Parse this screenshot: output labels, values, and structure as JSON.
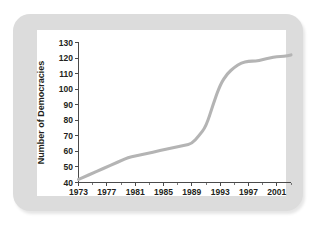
{
  "figure": {
    "frame_color": "#dcdcdc",
    "panel_color": "#ffffff"
  },
  "chart_data": {
    "type": "line",
    "title": "",
    "xlabel": "",
    "ylabel": "Number of Democracies",
    "xlim": [
      1973,
      2003
    ],
    "ylim": [
      40,
      130
    ],
    "grid": false,
    "legend": "none",
    "line_color": "#b4b4b4",
    "axis_color": "#4a4a4a",
    "xticks": [
      1973,
      1977,
      1981,
      1985,
      1989,
      1993,
      1997,
      2001
    ],
    "xtick_labels": [
      "1973",
      "1977",
      "1981",
      "1985",
      "1989",
      "1993",
      "1997",
      "2001"
    ],
    "xminor_ticks": [
      1975,
      1979,
      1983,
      1987,
      1991,
      1995,
      1999,
      2003
    ],
    "yticks": [
      40,
      50,
      60,
      70,
      80,
      90,
      100,
      110,
      120,
      130
    ],
    "ytick_labels": [
      "40",
      "50",
      "60",
      "70",
      "80",
      "90",
      "100",
      "110",
      "120",
      "130"
    ],
    "series": [
      {
        "name": "Number of Democracies",
        "x": [
          1973,
          1974,
          1975,
          1976,
          1977,
          1978,
          1979,
          1980,
          1981,
          1982,
          1983,
          1984,
          1985,
          1986,
          1987,
          1988,
          1989,
          1990,
          1991,
          1992,
          1993,
          1994,
          1995,
          1996,
          1997,
          1998,
          1999,
          2000,
          2001,
          2002,
          2003
        ],
        "values": [
          42,
          44,
          46,
          48,
          50,
          52,
          54,
          56,
          57,
          58,
          59,
          60,
          61,
          62,
          63,
          64,
          65,
          70,
          76,
          90,
          103,
          110,
          114,
          117,
          118,
          118,
          119,
          120,
          121,
          121,
          122
        ]
      }
    ]
  }
}
